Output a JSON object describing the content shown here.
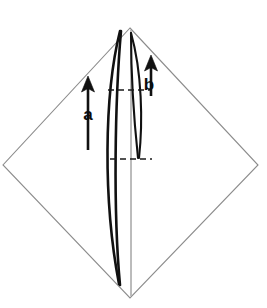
{
  "figure": {
    "canvas": {
      "width": 267,
      "height": 308,
      "background": "#ffffff"
    },
    "colors": {
      "outline": "#8c8c8c",
      "axis": "#b5b5b5",
      "curve": "#111111",
      "dash": "#1a1a1a",
      "label": "#0d0d0d"
    },
    "shapes": {
      "rhombus": {
        "name": "rhombus-outline",
        "points": "130,28 258,165 130,298 3,165",
        "top": {
          "x": 130,
          "y": 28
        },
        "right": {
          "x": 258,
          "y": 165
        },
        "bottom": {
          "x": 130,
          "y": 298
        },
        "left": {
          "x": 3,
          "y": 165
        }
      },
      "vertical_axis": {
        "name": "vertical-axis",
        "x": 131,
        "y1": 30,
        "y2": 296
      }
    },
    "curves": {
      "outer_left": {
        "name": "outer-left-curve",
        "path": "M 120,31 C 104,95 103,200 119,284"
      },
      "outer_right": {
        "name": "outer-right-curve",
        "path": "M 121,31 C 115,100 113,210 120,285"
      },
      "inner_left": {
        "name": "inner-left-curve",
        "path": "M 131,33 C 131,70 134,120 138,158"
      },
      "inner_right": {
        "name": "inner-right-curve",
        "path": "M 131,33 C 142,72 143,122 139,158"
      }
    },
    "dashes": [
      {
        "name": "dash-upper",
        "label": "upper reference level",
        "x1": 108,
        "x2": 150,
        "y": 90
      },
      {
        "name": "dash-lower",
        "label": "lower reference level",
        "x1": 110,
        "x2": 152,
        "y": 159
      }
    ],
    "arrows": [
      {
        "id": "a",
        "name": "arrow-a",
        "label": "a",
        "direction": "up",
        "tip": {
          "x": 88,
          "y": 77
        },
        "tail": {
          "x": 88,
          "y": 150
        },
        "label_position": {
          "x": 88,
          "y": 115
        }
      },
      {
        "id": "b",
        "name": "arrow-b",
        "label": "b",
        "direction": "up",
        "tip": {
          "x": 151,
          "y": 56
        },
        "tail": {
          "x": 151,
          "y": 96
        },
        "label_position": {
          "x": 149,
          "y": 85
        }
      }
    ]
  }
}
